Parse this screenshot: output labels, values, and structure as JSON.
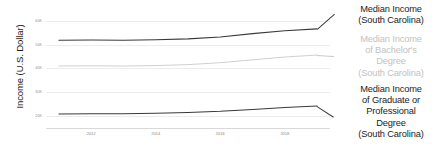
{
  "chart_data": {
    "type": "line",
    "title": "",
    "xlabel": "",
    "ylabel": "Income (U.S. Dollar)",
    "x": [
      2011,
      2012,
      2013,
      2014,
      2015,
      2016,
      2017,
      2018,
      2019
    ],
    "xlim": [
      2010.6,
      2019.4
    ],
    "ylim": [
      15000,
      62000
    ],
    "ytick_values": [
      60000,
      50000,
      40000,
      30000,
      20000
    ],
    "ytick_labels": [
      "60K",
      "50K",
      "40K",
      "30K",
      "20K"
    ],
    "xtick_values": [
      2012,
      2014,
      2016,
      2018
    ],
    "xtick_labels": [
      "2012",
      "2014",
      "2016",
      "2018"
    ],
    "grid": true,
    "grid_axis": "y",
    "legend_position": "right-inline-labels",
    "series": [
      {
        "name": "Median Income (South Carolina)",
        "color": "#3a3a3a",
        "values": [
          51800,
          51900,
          51800,
          52000,
          52400,
          53200,
          54600,
          55800,
          56600
        ]
      },
      {
        "name": "Median Income of Bachelor's Degree (South Carolina)",
        "color": "#c9c9c9",
        "values": [
          41000,
          41100,
          41000,
          41200,
          41600,
          42400,
          43600,
          44800,
          45600
        ]
      },
      {
        "name": "Median Income of Graduate or Professional Degree (South Carolina)",
        "color": "#3a3a3a",
        "values": [
          20900,
          21000,
          21000,
          21200,
          21500,
          22000,
          22800,
          23600,
          24200
        ]
      }
    ]
  },
  "legend": {
    "entries": [
      {
        "label": "Median Income\n(South Carolina)",
        "line1": "Median Income",
        "line2": "(South Carolina)",
        "line3": "",
        "line4": "",
        "color": "#1c1c1c"
      },
      {
        "label": "Median Income of Bachelor's Degree (South Carolina)",
        "line1": "Median Income",
        "line2": "of Bachelor's",
        "line3": "Degree",
        "line4": "(South Carolina)",
        "color": "#c2c2c2"
      },
      {
        "label": "Median Income of Graduate or Professional Degree (South Carolina)",
        "line1": "Median Income",
        "line2": "of Graduate or",
        "line3": "Professional",
        "line4": "Degree",
        "line5": "(South Carolina)",
        "color": "#1c1c1c"
      }
    ]
  },
  "axes": {
    "y_title": "Income (U.S. Dollar)"
  }
}
